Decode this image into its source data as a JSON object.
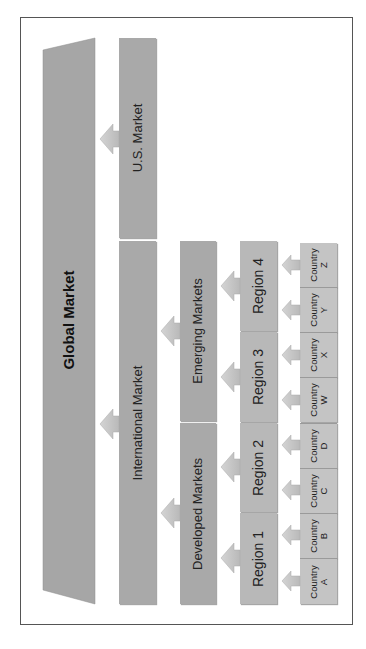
{
  "diagram": {
    "title": "Global Market",
    "levels": {
      "global": {
        "label": "Global Market"
      },
      "markets": [
        {
          "id": "us",
          "label": "U.S. Market"
        },
        {
          "id": "international",
          "label": "International Market"
        }
      ],
      "segments": [
        {
          "id": "emerging",
          "label": "Emerging Markets"
        },
        {
          "id": "developed",
          "label": "Developed Markets"
        }
      ],
      "regions": [
        {
          "id": "r4",
          "label": "Region 4"
        },
        {
          "id": "r3",
          "label": "Region 3"
        },
        {
          "id": "r2",
          "label": "Region 2"
        },
        {
          "id": "r1",
          "label": "Region 1"
        }
      ],
      "countries": [
        {
          "id": "z",
          "line1": "Country",
          "line2": "Z"
        },
        {
          "id": "y",
          "line1": "Country",
          "line2": "Y"
        },
        {
          "id": "x",
          "line1": "Country",
          "line2": "X"
        },
        {
          "id": "w",
          "line1": "Country",
          "line2": "W"
        },
        {
          "id": "d",
          "line1": "Country",
          "line2": "D"
        },
        {
          "id": "c",
          "line1": "Country",
          "line2": "C"
        },
        {
          "id": "b",
          "line1": "Country",
          "line2": "B"
        },
        {
          "id": "a",
          "line1": "Country",
          "line2": "A"
        }
      ]
    },
    "colors": {
      "box_dark": "#a9a9a9",
      "box_mid": "#b8b8b8",
      "box_light": "#c4c4c4",
      "arrow": "#c9c9c9",
      "border": "#555555",
      "text": "#222222"
    }
  }
}
